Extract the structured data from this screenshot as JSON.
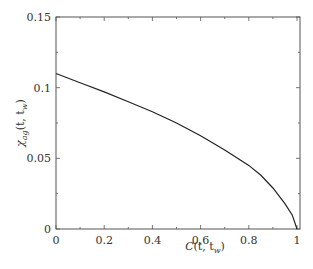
{
  "chart_data": {
    "type": "line",
    "title": "",
    "xlabel": "C(t,t_w)",
    "ylabel": "χ_ag(t,t_w)",
    "xlim": [
      0,
      1
    ],
    "ylim": [
      0,
      0.15
    ],
    "grid": false,
    "legend": null,
    "x_ticks": [
      "0",
      "0.2",
      "0.4",
      "0.6",
      "0.8",
      "1"
    ],
    "y_ticks": [
      "0",
      "0.05",
      "0.1",
      "0.15"
    ],
    "series": [
      {
        "name": "curve",
        "color": "#222222",
        "x": [
          0,
          0.1,
          0.2,
          0.3,
          0.4,
          0.5,
          0.6,
          0.7,
          0.8,
          0.85,
          0.9,
          0.95,
          0.98,
          1.0
        ],
        "y": [
          0.11,
          0.1035,
          0.097,
          0.09,
          0.083,
          0.075,
          0.066,
          0.056,
          0.045,
          0.038,
          0.029,
          0.018,
          0.01,
          0.0
        ]
      }
    ]
  },
  "axes": {
    "xlabel_main": "C",
    "xlabel_args": "(t, t",
    "xlabel_sub": "w",
    "xlabel_close": ")",
    "ylabel_main": "χ",
    "ylabel_sub": "ag",
    "ylabel_args": "(t, t",
    "ylabel_sub2": "w",
    "ylabel_close": ")"
  }
}
